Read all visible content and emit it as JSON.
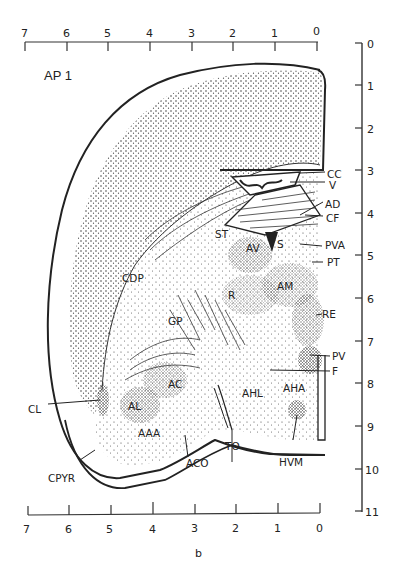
{
  "title": "AP 1",
  "caption": "b",
  "top_axis": {
    "ticks": [
      "7",
      "6",
      "5",
      "4",
      "3",
      "2",
      "1",
      "0"
    ]
  },
  "bottom_axis": {
    "ticks": [
      "7",
      "6",
      "5",
      "4",
      "3",
      "2",
      "1",
      "0"
    ]
  },
  "right_axis": {
    "ticks": [
      "0",
      "1",
      "2",
      "3",
      "4",
      "5",
      "6",
      "7",
      "8",
      "9",
      "10",
      "11"
    ]
  },
  "labels": {
    "CC": "CC",
    "V": "V",
    "AD": "AD",
    "CF": "CF",
    "PVA": "PVA",
    "PT": "PT",
    "RE": "RE",
    "PV": "PV",
    "F": "F",
    "ST": "ST",
    "AV": "AV",
    "S": "S",
    "AM": "AM",
    "R": "R",
    "CDP": "CDP",
    "GP": "GP",
    "AC": "AC",
    "AL": "AL",
    "AAA": "AAA",
    "CL": "CL",
    "CPYR": "CPYR",
    "ACO": "ACO",
    "TO": "TO",
    "AHL": "AHL",
    "AHA": "AHA",
    "HVM": "HVM"
  },
  "colors": {
    "ink": "#222222",
    "paper": "#ffffff"
  }
}
